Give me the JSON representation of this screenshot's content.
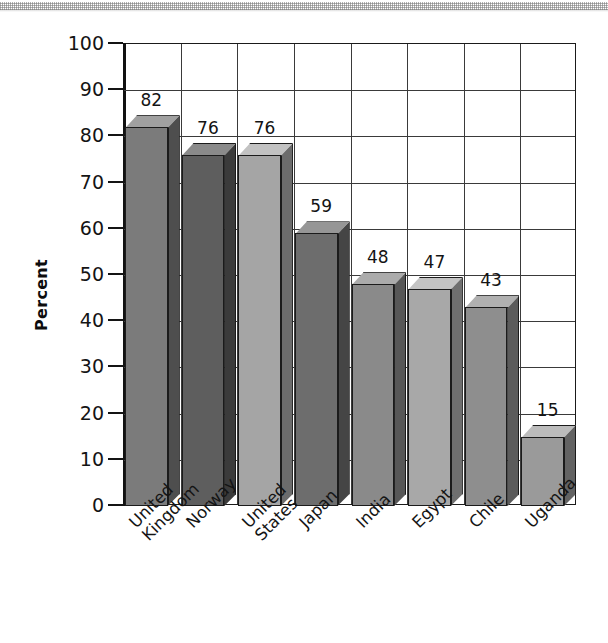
{
  "chart_data": {
    "type": "bar",
    "title": "",
    "subtitle": "",
    "xlabel": "",
    "ylabel": "Percent",
    "ylim": [
      0,
      100
    ],
    "ytick_step": 10,
    "yticks": [
      100,
      90,
      80,
      70,
      60,
      50,
      40,
      30,
      20,
      10,
      0
    ],
    "grid": true,
    "legend": "none",
    "style": "3d-bars-grayscale",
    "categories": [
      "United\nKingdom",
      "Norway",
      "United\nStates",
      "Japan",
      "India",
      "Egypt",
      "Chile",
      "Uganda"
    ],
    "values": [
      82,
      76,
      76,
      59,
      48,
      47,
      43,
      15
    ],
    "value_labels": [
      "82",
      "76",
      "76",
      "59",
      "48",
      "47",
      "43",
      "15"
    ],
    "bar_colors": [
      "#7b7b7b",
      "#5e5e5e",
      "#a5a5a5",
      "#6d6d6d",
      "#8a8a8a",
      "#a8a8a8",
      "#8e8e8e",
      "#9a9a9a"
    ],
    "bar_top_colors": [
      "#a0a0a0",
      "#8a8a8a",
      "#c2c2c2",
      "#969696",
      "#ababab",
      "#c4c4c4",
      "#b0b0b0",
      "#bcbcbc"
    ],
    "bar_side_colors": [
      "#4e4e4e",
      "#3b3b3b",
      "#6c6c6c",
      "#454545",
      "#575757",
      "#6f6f6f",
      "#5b5b5b",
      "#636363"
    ]
  },
  "axis": {
    "y_title": "Percent",
    "tick_labels": [
      "100",
      "90",
      "80",
      "70",
      "60",
      "50",
      "40",
      "30",
      "20",
      "10",
      "0"
    ]
  }
}
